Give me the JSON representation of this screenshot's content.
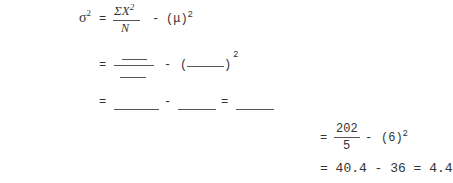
{
  "formula": {
    "lhs": "σ",
    "lhs_exp": "2",
    "eq": "=",
    "numerator": "ΣX",
    "numerator_exp": "2",
    "denominator": "N",
    "minus": "-",
    "mu_term": "(μ)",
    "mu_exp": "2"
  },
  "blank_row1": {
    "eq": "=",
    "minus": "-",
    "open_paren": "(",
    "close_paren": ")",
    "exp": "2"
  },
  "blank_row2": {
    "eq1": "=",
    "minus": "-",
    "eq2": "="
  },
  "worked": {
    "row1": {
      "eq": "=",
      "numerator": "202",
      "denominator": "5",
      "minus": "-",
      "term": "(6)",
      "exp": "2"
    },
    "row2": {
      "text": "= 40.4 - 36 = 4.4"
    }
  }
}
